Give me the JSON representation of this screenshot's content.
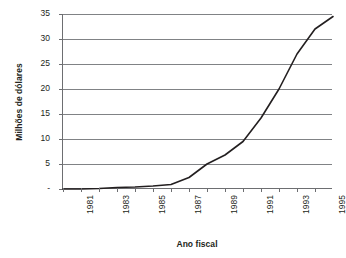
{
  "chart_data": {
    "type": "line",
    "title": "",
    "xlabel": "Ano fiscal",
    "ylabel": "Milhões de dólares",
    "x": [
      1981,
      1982,
      1983,
      1984,
      1985,
      1986,
      1987,
      1988,
      1989,
      1990,
      1991,
      1992,
      1993,
      1994,
      1995,
      1996
    ],
    "values": [
      0,
      0,
      0.1,
      0.3,
      0.4,
      0.6,
      0.9,
      2.3,
      5.0,
      6.8,
      9.5,
      14.2,
      20.0,
      27.0,
      32.0,
      34.5
    ],
    "xlim": [
      1981,
      1996
    ],
    "ylim": [
      0,
      35
    ],
    "ytick_values": [
      0,
      5,
      10,
      15,
      20,
      25,
      30,
      35
    ],
    "ytick_labels": [
      "-",
      "5",
      "10",
      "15",
      "20",
      "25",
      "30",
      "35"
    ],
    "xtick_values": [
      1981,
      1982,
      1983,
      1984,
      1985,
      1986,
      1987,
      1988,
      1989,
      1990,
      1991,
      1992,
      1993,
      1994,
      1995
    ],
    "xtick_labels": [
      "1981",
      "",
      "1983",
      "",
      "1985",
      "",
      "1987",
      "",
      "1989",
      "",
      "1991",
      "",
      "1993",
      "",
      "1995"
    ],
    "grid": "horizontal",
    "legend": "none",
    "line_color": "#231f20",
    "grid_color": "#808285",
    "axis_color": "#6d6e71",
    "background": "#ffffff"
  }
}
